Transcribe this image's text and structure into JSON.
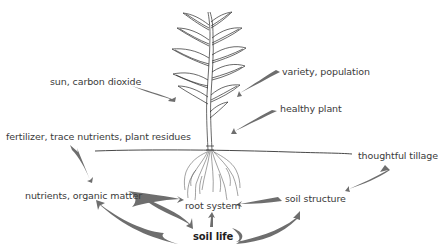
{
  "diagram": {
    "colors": {
      "arrow": "#6e6e6e",
      "line": "#333333",
      "text": "#3a3a3a",
      "background": "#ffffff"
    },
    "nodes": {
      "sun_co2": "sun, carbon dioxide",
      "variety": "variety, population",
      "healthy_plant": "healthy plant",
      "fertilizer": "fertilizer, trace nutrients, plant residues",
      "tillage": "thoughtful tillage",
      "nutrients": "nutrients, organic matter",
      "root_system": "root system",
      "soil_structure": "soil structure",
      "soil_life": "soil life"
    },
    "edges": [
      {
        "from": "sun, carbon dioxide",
        "to": "plant"
      },
      {
        "from": "variety, population",
        "to": "plant"
      },
      {
        "from": "healthy plant",
        "to": "plant"
      },
      {
        "from": "fertilizer, trace nutrients, plant residues",
        "to": "nutrients, organic matter"
      },
      {
        "from": "thoughtful tillage",
        "to": "soil structure"
      },
      {
        "from": "nutrients, organic matter",
        "to": "root system"
      },
      {
        "from": "nutrients, organic matter",
        "to": "soil life"
      },
      {
        "from": "soil life",
        "to": "nutrients, organic matter"
      },
      {
        "from": "soil life",
        "to": "root system"
      },
      {
        "from": "soil life",
        "to": "soil structure"
      },
      {
        "from": "soil structure",
        "to": "root system"
      }
    ]
  }
}
